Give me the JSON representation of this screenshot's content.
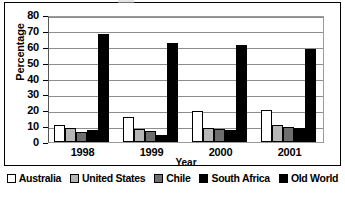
{
  "chart_data": {
    "type": "bar",
    "title": "",
    "xlabel": "Year",
    "ylabel": "Percentage",
    "categories": [
      "1998",
      "1999",
      "2000",
      "2001"
    ],
    "ylim": [
      0,
      80
    ],
    "yticks": [
      0,
      10,
      20,
      30,
      40,
      50,
      60,
      70,
      80
    ],
    "grid": true,
    "legend_position": "bottom",
    "series": [
      {
        "name": "Australia",
        "color": "#ffffff",
        "values": [
          11,
          16,
          19.5,
          20
        ]
      },
      {
        "name": "United States",
        "color": "#b6b6b6",
        "values": [
          9,
          8,
          9,
          10.5
        ]
      },
      {
        "name": "Chile",
        "color": "#6e6e6e",
        "values": [
          6,
          7,
          8,
          9.5
        ]
      },
      {
        "name": "South Africa",
        "color": "#000000",
        "values": [
          7.5,
          4.5,
          7.5,
          9
        ]
      },
      {
        "name": "Old World",
        "color": "#000000",
        "values": [
          68,
          62.5,
          61,
          58.5
        ]
      }
    ]
  },
  "axes": {
    "y_title": "Percentage",
    "x_title": "Year",
    "y_tick_labels": [
      "80",
      "70",
      "60",
      "50",
      "40",
      "30",
      "20",
      "10",
      "0"
    ],
    "x_tick_labels": [
      "1998",
      "1999",
      "2000",
      "2001"
    ]
  },
  "legend": {
    "items": [
      {
        "label": "Australia",
        "swatch": "swatch-white",
        "color": "#ffffff"
      },
      {
        "label": "United States",
        "swatch": "swatch-light-gray",
        "color": "#b6b6b6"
      },
      {
        "label": "Chile",
        "swatch": "swatch-dark-gray",
        "color": "#6e6e6e"
      },
      {
        "label": "South Africa",
        "swatch": "swatch-black",
        "color": "#000000"
      },
      {
        "label": "Old World",
        "swatch": "swatch-black",
        "color": "#000000"
      }
    ]
  }
}
